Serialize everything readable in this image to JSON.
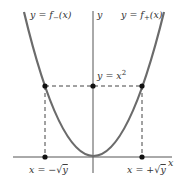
{
  "diagram": {
    "type": "function-graph",
    "colors": {
      "curve": "#6b6b6b",
      "axis": "#555555",
      "dashed": "#444444",
      "point": "#111111",
      "text": "#333333"
    },
    "labels": {
      "f_minus": "y = f−(x)",
      "f_minus_prefix": "y = f",
      "f_minus_sub": "−",
      "f_minus_suffix": "(x)",
      "f_plus_prefix": "y = f",
      "f_plus_sub": "+",
      "f_plus_suffix": "(x)",
      "y_axis": "y",
      "x_axis": "x",
      "curve_point_prefix": "y = x",
      "curve_point_exp": "2",
      "neg_root_prefix": "x = −",
      "pos_root_prefix": "x = +",
      "root_symbol": "√",
      "root_arg": "y"
    }
  }
}
